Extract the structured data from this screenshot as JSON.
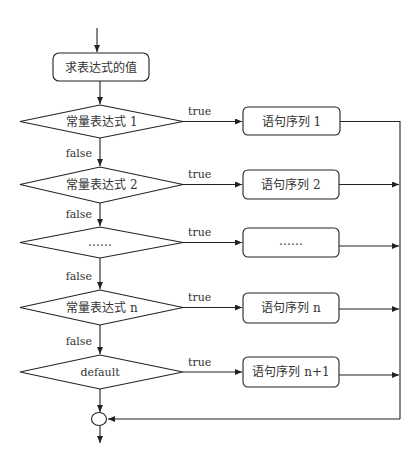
{
  "diagram": {
    "start_box": {
      "label": "求表达式的值"
    },
    "decisions": [
      {
        "label": "常量表达式 1",
        "true_label": "true",
        "false_label": "false"
      },
      {
        "label": "常量表达式 2",
        "true_label": "true",
        "false_label": "false"
      },
      {
        "label": "……",
        "true_label": "true",
        "false_label": "false"
      },
      {
        "label": "常量表达式 n",
        "true_label": "true",
        "false_label": "false"
      },
      {
        "label": "default",
        "true_label": "true"
      }
    ],
    "statements": [
      {
        "label": "语句序列 1"
      },
      {
        "label": "语句序列 2"
      },
      {
        "label": "……"
      },
      {
        "label": "语句序列 n"
      },
      {
        "label": "语句序列 n+1"
      }
    ],
    "colors": {
      "stroke": "#222222",
      "text": "#333333",
      "background": "#ffffff"
    }
  }
}
